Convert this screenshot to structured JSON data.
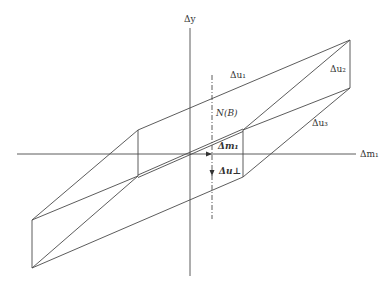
{
  "diagram": {
    "axes": {
      "y_label": "Δy",
      "x_label": "Δm₁"
    },
    "labels": {
      "du1": "Δu₁",
      "du2": "Δu₂",
      "du3": "Δu₃",
      "null_space": "N(B)",
      "dm1_vector": "Δm₁",
      "du_perp": "Δu⊥"
    },
    "colors": {
      "line": "#4a4a4a",
      "background": "#ffffff"
    }
  }
}
